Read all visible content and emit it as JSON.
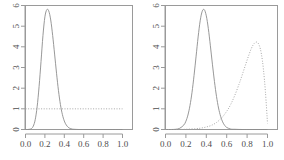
{
  "figure": {
    "background": "#ffffff",
    "axis_color": "#808080",
    "curve_color": "#8c8c8c",
    "panels": 2
  },
  "chart_data": [
    {
      "type": "line",
      "panel": "left",
      "title": "",
      "xlabel": "",
      "ylabel": "",
      "xlim": [
        0.0,
        1.0
      ],
      "ylim": [
        0,
        6
      ],
      "xticks": [
        "0.0",
        "0.2",
        "0.4",
        "0.6",
        "0.8",
        "1.0"
      ],
      "xtick_values": [
        0.0,
        0.2,
        0.4,
        0.6,
        0.8,
        1.0
      ],
      "yticks": [
        "0",
        "1",
        "2",
        "3",
        "4",
        "5",
        "6"
      ],
      "ytick_values": [
        0,
        1,
        2,
        3,
        4,
        5,
        6
      ],
      "grid": false,
      "legend": "none",
      "series": [
        {
          "name": "posterior",
          "style": "solid",
          "color": "#8c8c8c",
          "x": [
            0.0,
            0.02,
            0.04,
            0.06,
            0.08,
            0.1,
            0.12,
            0.14,
            0.16,
            0.18,
            0.2,
            0.22,
            0.24,
            0.26,
            0.28,
            0.3,
            0.32,
            0.34,
            0.36,
            0.38,
            0.4,
            0.42,
            0.44,
            0.46,
            0.48,
            0.5,
            0.55,
            0.6,
            0.7,
            0.8,
            0.9,
            1.0
          ],
          "values": [
            0.0,
            0.0,
            0.01,
            0.04,
            0.16,
            0.47,
            1.1,
            2.08,
            3.29,
            4.55,
            5.45,
            5.8,
            5.73,
            5.3,
            4.55,
            3.65,
            2.72,
            1.88,
            1.21,
            0.73,
            0.41,
            0.22,
            0.11,
            0.05,
            0.02,
            0.01,
            0.0,
            0.0,
            0.0,
            0.0,
            0.0,
            0.0
          ]
        },
        {
          "name": "prior",
          "style": "dotted",
          "color": "#9e9e9e",
          "x": [
            0.0,
            1.0
          ],
          "values": [
            1.0,
            1.0
          ]
        }
      ]
    },
    {
      "type": "line",
      "panel": "right",
      "title": "",
      "xlabel": "",
      "ylabel": "",
      "xlim": [
        0.0,
        1.0
      ],
      "ylim": [
        0,
        6
      ],
      "xticks": [
        "0.0",
        "0.2",
        "0.4",
        "0.6",
        "0.8",
        "1.0"
      ],
      "xtick_values": [
        0.0,
        0.2,
        0.4,
        0.6,
        0.8,
        1.0
      ],
      "yticks": [
        "0",
        "1",
        "2",
        "3",
        "4",
        "5",
        "6"
      ],
      "ytick_values": [
        0,
        1,
        2,
        3,
        4,
        5,
        6
      ],
      "grid": false,
      "legend": "none",
      "series": [
        {
          "name": "posterior-1",
          "style": "solid",
          "color": "#8c8c8c",
          "x": [
            0.0,
            0.05,
            0.1,
            0.14,
            0.18,
            0.2,
            0.22,
            0.24,
            0.26,
            0.28,
            0.3,
            0.32,
            0.34,
            0.36,
            0.38,
            0.4,
            0.42,
            0.44,
            0.46,
            0.48,
            0.5,
            0.52,
            0.54,
            0.56,
            0.58,
            0.6,
            0.64,
            0.68,
            0.75,
            0.85,
            1.0
          ],
          "values": [
            0.0,
            0.0,
            0.01,
            0.06,
            0.22,
            0.4,
            0.7,
            1.16,
            1.8,
            2.62,
            3.55,
            4.48,
            5.26,
            5.72,
            5.8,
            5.5,
            4.88,
            4.05,
            3.16,
            2.32,
            1.6,
            1.04,
            0.64,
            0.37,
            0.2,
            0.1,
            0.02,
            0.01,
            0.0,
            0.0,
            0.0
          ]
        },
        {
          "name": "posterior-2",
          "style": "dotted",
          "color": "#9e9e9e",
          "x": [
            0.0,
            0.1,
            0.2,
            0.3,
            0.35,
            0.4,
            0.45,
            0.5,
            0.55,
            0.6,
            0.64,
            0.68,
            0.72,
            0.74,
            0.76,
            0.78,
            0.8,
            0.82,
            0.84,
            0.86,
            0.88,
            0.9,
            0.92,
            0.94,
            0.96,
            0.98,
            1.0
          ],
          "values": [
            0.0,
            0.0,
            0.01,
            0.04,
            0.07,
            0.12,
            0.2,
            0.34,
            0.56,
            0.88,
            1.22,
            1.66,
            2.18,
            2.46,
            2.76,
            3.06,
            3.36,
            3.64,
            3.9,
            4.1,
            4.21,
            4.22,
            4.06,
            3.66,
            2.92,
            1.8,
            0.3
          ]
        }
      ]
    }
  ]
}
